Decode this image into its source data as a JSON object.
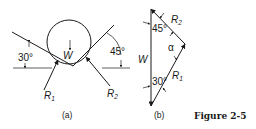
{
  "figure": {
    "caption": "Figure 2-5",
    "panel_a": {
      "label": "(a)",
      "angle_left": "30°",
      "angle_right": "45°",
      "weight": "W",
      "reaction_1": "R",
      "reaction_1_sub": "1",
      "reaction_2": "R",
      "reaction_2_sub": "2"
    },
    "panel_b": {
      "label": "(b)",
      "angle_top": "45°",
      "angle_bottom": "30°",
      "angle_alpha": "α",
      "weight": "W",
      "reaction_1": "R",
      "reaction_1_sub": "1",
      "reaction_2": "R",
      "reaction_2_sub": "2"
    }
  }
}
